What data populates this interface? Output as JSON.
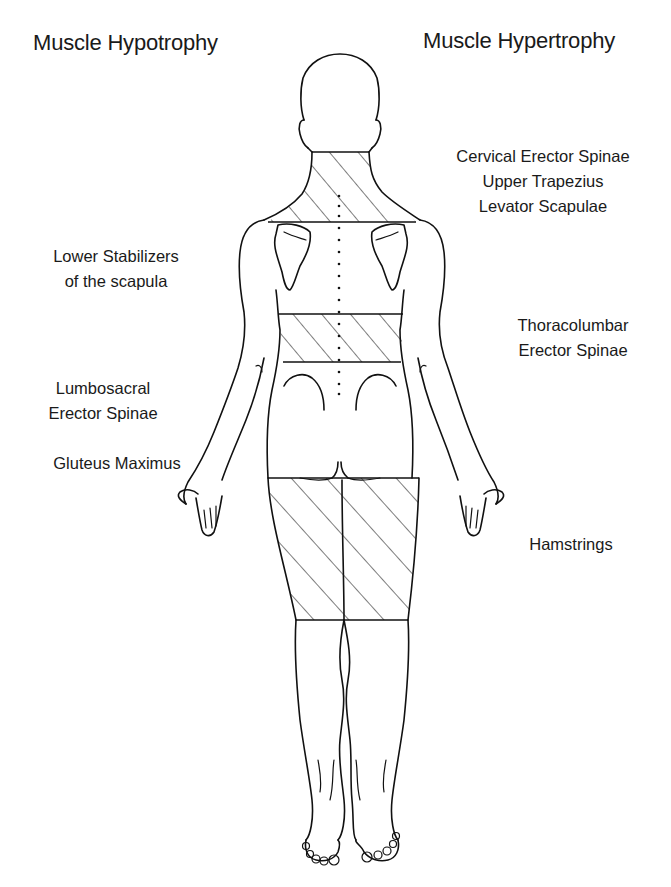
{
  "titles": {
    "left": "Muscle Hypotrophy",
    "right": "Muscle Hypertrophy"
  },
  "labels_left": [
    {
      "id": "lower-stabilizers",
      "lines": [
        "Lower Stabilizers",
        "of the scapula"
      ]
    },
    {
      "id": "lumbosacral-erector-spinae",
      "lines": [
        "Lumbosacral",
        "Erector Spinae"
      ]
    },
    {
      "id": "gluteus-maximus",
      "lines": [
        "Gluteus Maximus"
      ]
    }
  ],
  "labels_right": [
    {
      "id": "cervical-group",
      "lines": [
        "Cervical Erector Spinae",
        "Upper Trapezius",
        "Levator Scapulae"
      ]
    },
    {
      "id": "thoracolumbar-erector-spinae",
      "lines": [
        "Thoracolumbar",
        "Erector Spinae"
      ]
    },
    {
      "id": "hamstrings",
      "lines": [
        "Hamstrings"
      ]
    }
  ],
  "figure": {
    "view": "posterior body outline",
    "hatched_regions": [
      "neck-and-upper-shoulders",
      "thoracolumbar-band",
      "posterior-thighs"
    ],
    "stroke_color": "#111111",
    "background_color": "#ffffff"
  }
}
